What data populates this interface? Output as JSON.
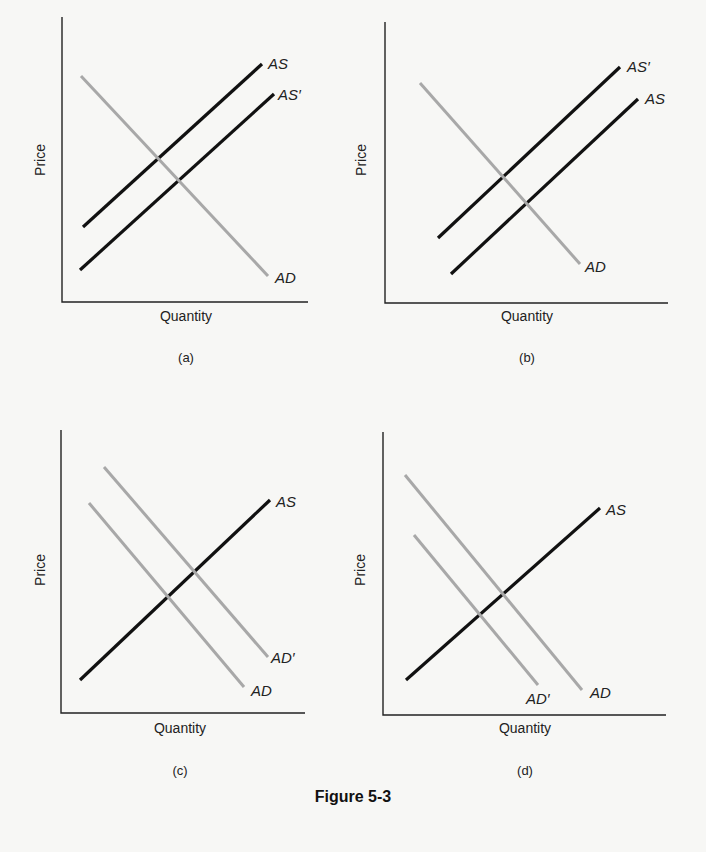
{
  "figure": {
    "caption": "Figure 5-3",
    "colors": {
      "supply": "#111111",
      "demand": "#a8a8a8",
      "axis": "#222222"
    }
  },
  "chart_data": [
    {
      "type": "line",
      "panel": "(a)",
      "title": "",
      "xlabel": "Quantity",
      "ylabel": "Price",
      "grid": false,
      "axes": {
        "x0": 62,
        "y0": 302,
        "xmax": 308,
        "ytop": 17,
        "labelPos": {
          "ylabel": [
            45,
            160
          ],
          "xlabel": [
            186,
            321
          ],
          "panel": [
            186,
            362
          ]
        }
      },
      "series": [
        {
          "name": "AS",
          "kind": "supply",
          "points": [
            [
              83,
              227
            ],
            [
              262,
              64
            ]
          ],
          "label": "AS",
          "labelAt": [
            268,
            69
          ]
        },
        {
          "name": "AS'",
          "kind": "supply",
          "points": [
            [
              80,
              270
            ],
            [
              274,
              94
            ]
          ],
          "label": "AS′",
          "labelAt": [
            278,
            100
          ]
        },
        {
          "name": "AD",
          "kind": "demand",
          "points": [
            [
              81,
              76
            ],
            [
              268,
              276
            ]
          ],
          "label": "AD",
          "labelAt": [
            275,
            283
          ]
        }
      ],
      "description": "Aggregate supply shifts right/down (AS to AS'), AD unchanged"
    },
    {
      "type": "line",
      "panel": "(b)",
      "title": "",
      "xlabel": "Quantity",
      "ylabel": "Price",
      "grid": false,
      "axes": {
        "x0": 385,
        "y0": 303,
        "xmax": 668,
        "ytop": 22,
        "labelPos": {
          "ylabel": [
            366,
            160
          ],
          "xlabel": [
            527,
            321
          ],
          "panel": [
            527,
            362
          ]
        }
      },
      "series": [
        {
          "name": "AS'",
          "kind": "supply",
          "points": [
            [
              438,
              238
            ],
            [
              620,
              67
            ]
          ],
          "label": "AS′",
          "labelAt": [
            627,
            72
          ]
        },
        {
          "name": "AS",
          "kind": "supply",
          "points": [
            [
              451,
              274
            ],
            [
              638,
              99
            ]
          ],
          "label": "AS",
          "labelAt": [
            645,
            104
          ]
        },
        {
          "name": "AD",
          "kind": "demand",
          "points": [
            [
              420,
              83
            ],
            [
              580,
              264
            ]
          ],
          "label": "AD",
          "labelAt": [
            585,
            272
          ]
        }
      ],
      "description": "Aggregate supply shifts left/up (AS to AS'), AD unchanged"
    },
    {
      "type": "line",
      "panel": "(c)",
      "title": "",
      "xlabel": "Quantity",
      "ylabel": "Price",
      "grid": false,
      "axes": {
        "x0": 61,
        "y0": 713,
        "xmax": 305,
        "ytop": 430,
        "labelPos": {
          "ylabel": [
            45,
            570
          ],
          "xlabel": [
            180,
            733
          ],
          "panel": [
            180,
            775
          ]
        }
      },
      "series": [
        {
          "name": "AS",
          "kind": "supply",
          "points": [
            [
              80,
              680
            ],
            [
              270,
              500
            ]
          ],
          "label": "AS",
          "labelAt": [
            276,
            507
          ]
        },
        {
          "name": "AD'",
          "kind": "demand",
          "points": [
            [
              104,
              467
            ],
            [
              268,
              657
            ]
          ],
          "label": "AD′",
          "labelAt": [
            271,
            663
          ]
        },
        {
          "name": "AD",
          "kind": "demand",
          "points": [
            [
              89,
              503
            ],
            [
              244,
              687
            ]
          ],
          "label": "AD",
          "labelAt": [
            251,
            696
          ]
        }
      ],
      "description": "Aggregate demand shifts right/up (AD to AD'), AS unchanged"
    },
    {
      "type": "line",
      "panel": "(d)",
      "title": "",
      "xlabel": "Quantity",
      "ylabel": "Price",
      "grid": false,
      "axes": {
        "x0": 383,
        "y0": 715,
        "xmax": 666,
        "ytop": 432,
        "labelPos": {
          "ylabel": [
            365,
            570
          ],
          "xlabel": [
            525,
            733
          ],
          "panel": [
            525,
            775
          ]
        }
      },
      "series": [
        {
          "name": "AS",
          "kind": "supply",
          "points": [
            [
              406,
              680
            ],
            [
              600,
              508
            ]
          ],
          "label": "AS",
          "labelAt": [
            606,
            515
          ]
        },
        {
          "name": "AD",
          "kind": "demand",
          "points": [
            [
              405,
              475
            ],
            [
              582,
              690
            ]
          ],
          "label": "AD",
          "labelAt": [
            590,
            698
          ]
        },
        {
          "name": "AD'",
          "kind": "demand",
          "points": [
            [
              414,
              535
            ],
            [
              538,
              685
            ]
          ],
          "label": "AD′",
          "labelAt": [
            526,
            704
          ]
        }
      ],
      "description": "Aggregate demand shifts left/down (AD to AD'), AS unchanged"
    }
  ]
}
